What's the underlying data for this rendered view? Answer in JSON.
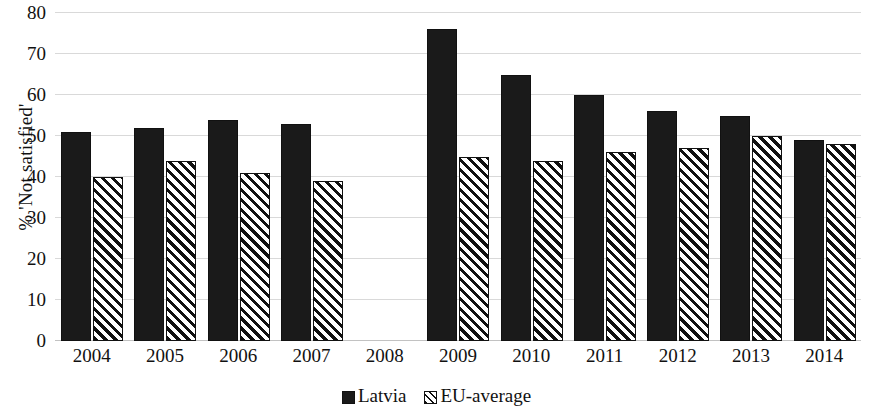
{
  "chart_data": {
    "type": "bar",
    "title": "",
    "xlabel": "",
    "ylabel": "% 'Not satisfied'",
    "ylim": [
      0,
      80
    ],
    "yticks": [
      0,
      10,
      20,
      30,
      40,
      50,
      60,
      70,
      80
    ],
    "ytick_labels": [
      "0",
      "10",
      "20",
      "30",
      "40",
      "50",
      "60",
      "70",
      "80"
    ],
    "grid": true,
    "legend_position": "bottom-center",
    "categories": [
      "2004",
      "2005",
      "2006",
      "2007",
      "2008",
      "2009",
      "2010",
      "2011",
      "2012",
      "2013",
      "2014"
    ],
    "series": [
      {
        "name": "Latvia",
        "fill": "solid",
        "color": "#1a1a1a",
        "values": [
          51,
          52,
          54,
          53,
          null,
          76,
          65,
          60,
          56,
          55,
          49
        ]
      },
      {
        "name": "EU-average",
        "fill": "diagonal-hatch",
        "color": "#111111",
        "values": [
          40,
          44,
          41,
          39,
          null,
          45,
          44,
          46,
          47,
          50,
          48
        ]
      }
    ]
  },
  "legend": {
    "entries": [
      {
        "label": "Latvia",
        "swatch": "solid-square-icon"
      },
      {
        "label": "EU-average",
        "swatch": "hatched-square-icon"
      }
    ]
  }
}
